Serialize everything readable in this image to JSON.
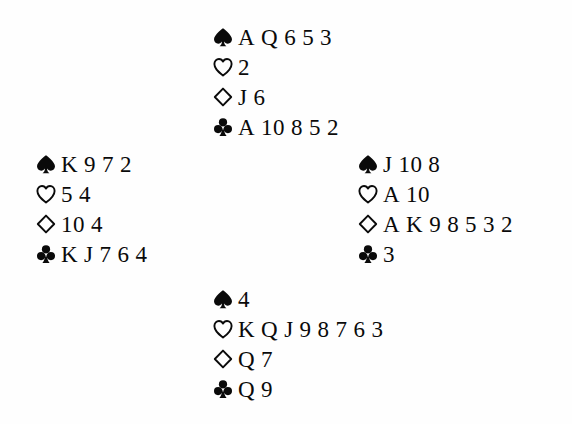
{
  "diagram": {
    "layout": "cross",
    "suit_order": [
      "spades",
      "hearts",
      "diamonds",
      "clubs"
    ],
    "suit_glyphs": {
      "spades": "spade-icon",
      "hearts": "heart-icon",
      "diamonds": "diamond-icon",
      "clubs": "club-icon"
    },
    "suit_fill": {
      "spades": "solid",
      "hearts": "outline",
      "diamonds": "outline",
      "clubs": "solid"
    },
    "ink_color": "#0a0a0a",
    "background_color": "#fefefe"
  },
  "hands": {
    "north": {
      "position": "north",
      "suits": [
        {
          "suit": "spades",
          "cards": [
            "A",
            "Q",
            "6",
            "5",
            "3"
          ]
        },
        {
          "suit": "hearts",
          "cards": [
            "2"
          ]
        },
        {
          "suit": "diamonds",
          "cards": [
            "J",
            "6"
          ]
        },
        {
          "suit": "clubs",
          "cards": [
            "A",
            "10",
            "8",
            "5",
            "2"
          ]
        }
      ]
    },
    "west": {
      "position": "west",
      "suits": [
        {
          "suit": "spades",
          "cards": [
            "K",
            "9",
            "7",
            "2"
          ]
        },
        {
          "suit": "hearts",
          "cards": [
            "5",
            "4"
          ]
        },
        {
          "suit": "diamonds",
          "cards": [
            "10",
            "4"
          ]
        },
        {
          "suit": "clubs",
          "cards": [
            "K",
            "J",
            "7",
            "6",
            "4"
          ]
        }
      ]
    },
    "east": {
      "position": "east",
      "suits": [
        {
          "suit": "spades",
          "cards": [
            "J",
            "10",
            "8"
          ]
        },
        {
          "suit": "hearts",
          "cards": [
            "A",
            "10"
          ]
        },
        {
          "suit": "diamonds",
          "cards": [
            "A",
            "K",
            "9",
            "8",
            "5",
            "3",
            "2"
          ]
        },
        {
          "suit": "clubs",
          "cards": [
            "3"
          ]
        }
      ]
    },
    "south": {
      "position": "south",
      "suits": [
        {
          "suit": "spades",
          "cards": [
            "4"
          ]
        },
        {
          "suit": "hearts",
          "cards": [
            "K",
            "Q",
            "J",
            "9",
            "8",
            "7",
            "6",
            "3"
          ]
        },
        {
          "suit": "diamonds",
          "cards": [
            "Q",
            "7"
          ]
        },
        {
          "suit": "clubs",
          "cards": [
            "Q",
            "9"
          ]
        }
      ]
    }
  }
}
